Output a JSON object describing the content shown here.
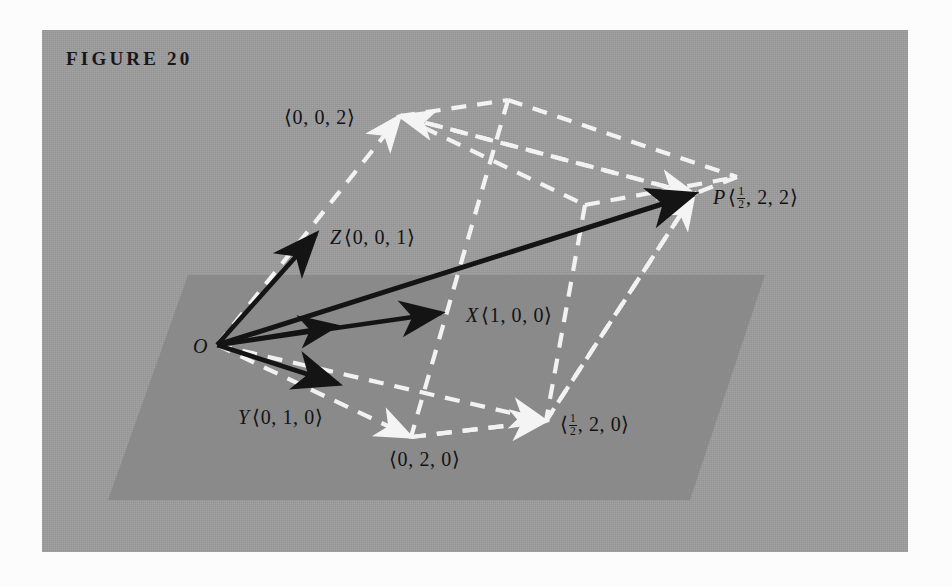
{
  "figure": {
    "caption": "FIGURE 20",
    "panel_bg": "#9d9d9d",
    "plane_fill": "#8a8a8a",
    "vector_color": "#141414",
    "dashed_color": "#f2f2f2",
    "page_bg": "#fcfcfc"
  },
  "labels": {
    "origin": "O",
    "z_axis": {
      "symbol": "Z",
      "coords": "⟨0, 0, 1⟩"
    },
    "x_axis": {
      "symbol": "X",
      "coords": "⟨1, 0, 0⟩"
    },
    "y_axis": {
      "symbol": "Y",
      "coords": "⟨0, 1, 0⟩"
    },
    "z_double": "⟨0, 0, 2⟩",
    "y_double": "⟨0, 2, 0⟩",
    "point_p_symbol": "P",
    "point_p_open": "⟨",
    "point_p_rest": ", 2, 2⟩",
    "base_open": "⟨",
    "base_rest": ", 2, 0⟩",
    "half_num": "1",
    "half_den": "2"
  },
  "geometry": {
    "origin": [
      217,
      345
    ],
    "plane_quad": [
      [
        188,
        275
      ],
      [
        765,
        275
      ],
      [
        690,
        500
      ],
      [
        108,
        500
      ]
    ],
    "vectors": [
      {
        "name": "z-unit",
        "from": [
          217,
          345
        ],
        "to": [
          316,
          234
        ]
      },
      {
        "name": "x-short-unit",
        "from": [
          217,
          345
        ],
        "to": [
          336,
          326
        ]
      },
      {
        "name": "x-unit",
        "from": [
          217,
          345
        ],
        "to": [
          441,
          313
        ]
      },
      {
        "name": "y-unit",
        "from": [
          217,
          345
        ],
        "to": [
          338,
          384
        ]
      },
      {
        "name": "op-resultant",
        "from": [
          217,
          345
        ],
        "to": [
          694,
          194
        ]
      }
    ],
    "dashed_vectors": [
      {
        "name": "to-z-double",
        "from": [
          217,
          345
        ],
        "to": [
          400,
          116
        ]
      },
      {
        "name": "to-y-double",
        "from": [
          217,
          345
        ],
        "to": [
          411,
          437
        ]
      },
      {
        "name": "to-base-half",
        "from": [
          217,
          345
        ],
        "to": [
          546,
          421
        ]
      },
      {
        "name": "z-double-to-p",
        "from": [
          400,
          116
        ],
        "to": [
          694,
          194
        ]
      },
      {
        "name": "p-to-z-double",
        "from": [
          694,
          194
        ],
        "to": [
          400,
          116
        ]
      },
      {
        "name": "y-double-to-base",
        "from": [
          411,
          437
        ],
        "to": [
          546,
          421
        ]
      }
    ],
    "parallelepiped_vertices": {
      "O": [
        217,
        345
      ],
      "Z2": [
        400,
        116
      ],
      "Y2": [
        411,
        437
      ],
      "H2": [
        546,
        421
      ],
      "P": [
        694,
        194
      ],
      "T": [
        508,
        100
      ],
      "M": [
        585,
        205
      ],
      "R": [
        737,
        177
      ]
    }
  }
}
